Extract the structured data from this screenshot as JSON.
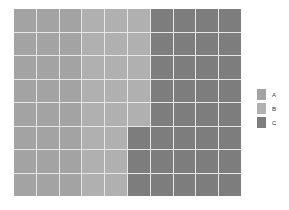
{
  "chart_data": {
    "type": "waffle",
    "title": "",
    "xlabel": "",
    "ylabel": "",
    "grid": {
      "rows": 8,
      "columns": 10,
      "fill_order": "column-major, top-to-bottom"
    },
    "categories": [
      "A",
      "B",
      "C"
    ],
    "values": [
      24,
      21,
      35
    ],
    "colors": {
      "A": "#a3a3a3",
      "B": "#b0b0b0",
      "C": "#7d7d7d"
    },
    "legend_position": "right",
    "total": 80
  },
  "legend": {
    "items": [
      {
        "label": "A",
        "color": "#a3a3a3"
      },
      {
        "label": "B",
        "color": "#b0b0b0"
      },
      {
        "label": "C",
        "color": "#7d7d7d"
      }
    ]
  }
}
